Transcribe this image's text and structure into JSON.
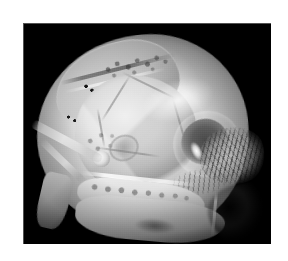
{
  "figure": {
    "kind": "micro-ct-volume-render",
    "background_color": "#000000",
    "page_color": "#ffffff",
    "panel": {
      "x": 23,
      "y": 23,
      "width": 248,
      "height": 221,
      "rim_color": "#969696"
    },
    "caption": "",
    "label": "",
    "scale_bar": ""
  },
  "anatomy": {
    "structures": [
      {
        "name": "parietal-plate",
        "label": "dorsal cranial plate",
        "tone": "#e0e0e0"
      },
      {
        "name": "dorsal-porous-patch",
        "label": "dorsal foramina field",
        "tone": "#3c3c3c"
      },
      {
        "name": "marker-dots-upper",
        "label": "upper marker dot run",
        "tone": "#141414",
        "count": 4
      },
      {
        "name": "marker-dots-lower",
        "label": "lower marker dot run",
        "tone": "#1a1a1a",
        "count": 4
      },
      {
        "name": "cranial-vault",
        "label": "faceted cranial vault",
        "tone": "#dedede"
      },
      {
        "name": "orbit-socket",
        "label": "orbit / eye socket",
        "tone": "#5c5c5c"
      },
      {
        "name": "orbit-specular",
        "label": "orbit specular highlight",
        "tone": "#ffffff"
      },
      {
        "name": "trabecular-bundle",
        "label": "temporal trabecular striations",
        "tone": "#1c1c1c"
      },
      {
        "name": "trabecular-fan",
        "label": "basal striation fan",
        "tone": "#282828"
      },
      {
        "name": "zygomatic-arch",
        "label": "zygomatic arch",
        "tone": "#f4f4f4"
      },
      {
        "name": "left-blade",
        "label": "angular / pterygoid blade",
        "tone": "#cccccc"
      },
      {
        "name": "tooth-row",
        "label": "molar tooth row",
        "tone": "#464646",
        "count": 8
      },
      {
        "name": "palate-shelf",
        "label": "palate / basicranial shelf",
        "tone": "#d0d0d0"
      },
      {
        "name": "foramen-bubble",
        "label": "bright foramen",
        "tone": "#ffffff"
      },
      {
        "name": "cavity-ring",
        "label": "oval cavity ring",
        "tone": "#969696"
      },
      {
        "name": "occipital-shadow",
        "label": "occipital shadow",
        "tone": "#373737"
      }
    ]
  }
}
